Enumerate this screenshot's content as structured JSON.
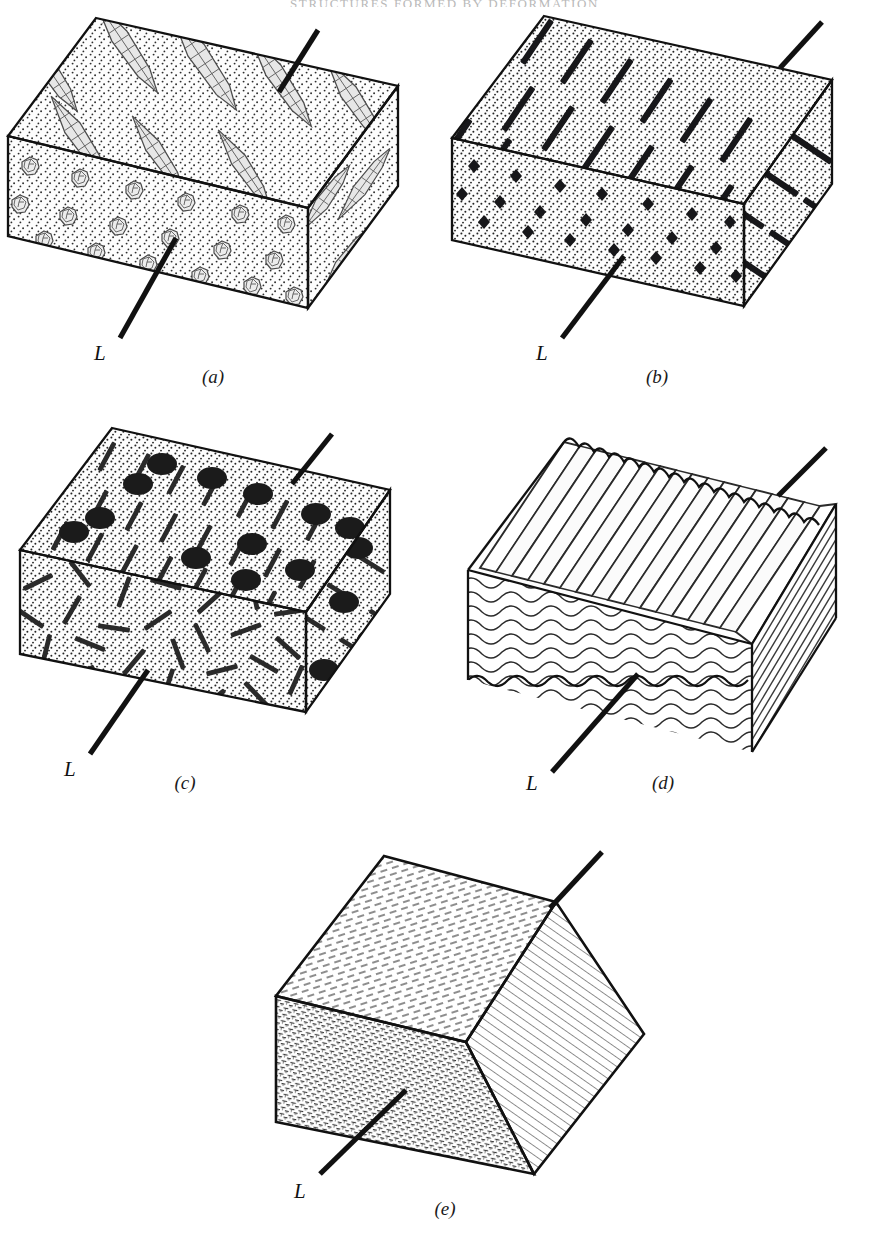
{
  "page": {
    "running_head": "STRUCTURES FORMED BY DEFORMATION",
    "width": 889,
    "height": 1239,
    "background": "#ffffff",
    "ink": "#111111"
  },
  "figure": {
    "type": "geological-block-diagram-set",
    "lineation_symbol": "L",
    "panels": [
      {
        "id": "a",
        "caption": "(a)",
        "lineation_label": "L",
        "structure": "stretched-pebble-lineation",
        "top_face_texture": "elongate-flattened-clast-aggregates",
        "front_face_texture": "round-clast-cross-sections",
        "side_face_texture": "elongate-clast-streaks",
        "matrix": "stipple",
        "clast_fill": "#e9e9e9",
        "clast_outline": "#4a4a4a"
      },
      {
        "id": "b",
        "caption": "(b)",
        "lineation_label": "L",
        "structure": "aligned-prismatic-mineral-lineation",
        "top_face_texture": "long-dark-prism-rods-aligned",
        "front_face_texture": "small-dark-diamond-cross-sections",
        "side_face_texture": "long-dark-prism-rods-aligned",
        "matrix": "stipple",
        "mineral_color": "#17171a"
      },
      {
        "id": "c",
        "caption": "(c)",
        "lineation_label": "L",
        "structure": "aligned-rods-with-dark-nodules",
        "top_face_texture": "aligned-rods-and-dark-ovoid-nodules",
        "front_face_texture": "randomly-oriented-rods",
        "side_face_texture": "aligned-rods-and-dark-nodules",
        "matrix": "stipple",
        "nodule_color": "#1b1b1b",
        "rod_color": "#2a2a2a"
      },
      {
        "id": "d",
        "caption": "(d)",
        "lineation_label": "L",
        "structure": "crenulation-fold-hinge-lineation",
        "top_face_texture": "corrugated-parallel-ridges",
        "front_face_texture": "wavy-crenulated-layer-traces",
        "side_face_texture": "straight-parallel-layer-traces",
        "line_color": "#2b2b2b"
      },
      {
        "id": "e",
        "caption": "(e)",
        "lineation_label": "L",
        "structure": "mineral-streaking-on-foliation",
        "top_face_texture": "short-dashes-sparse",
        "front_face_texture": "dense-fibrous-mica-flakes",
        "side_face_texture": "fine-parallel-hatch-lines",
        "line_color": "#3a3a3a"
      }
    ]
  }
}
